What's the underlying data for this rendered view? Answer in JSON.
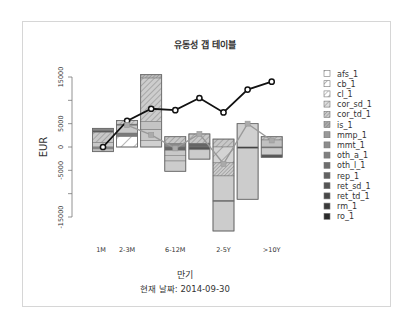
{
  "chart_data": {
    "type": "bar",
    "title": "유동성 갭 테이블",
    "xlabel": "만기",
    "subtitle": "현재 날짜: 2014-09-30",
    "ylabel": "EUR",
    "ylim": [
      -18000,
      16000
    ],
    "yticks": [
      15000,
      10000,
      5000,
      0,
      -5000,
      -10000,
      -15000
    ],
    "ytick_labels": [
      "15000",
      "",
      "5000",
      "0",
      "-5000",
      "",
      "-15000"
    ],
    "categories": [
      "1M",
      "2-3M",
      "3-6M",
      "6-12M",
      "1-2Y",
      "2-5Y",
      "5-10Y",
      ">10Y"
    ],
    "category_labels_shown": [
      "1M",
      "2-3M",
      "",
      "6-12M",
      "",
      "2-5Y",
      "",
      ">10Y"
    ],
    "bars": [
      {
        "category": "1M",
        "segments": [
          {
            "from": 0,
            "to": 1000,
            "fill": "#c8c8c8",
            "pattern": "none"
          },
          {
            "from": 1000,
            "to": 3200,
            "fill": "#c8c8c8",
            "pattern": "hatch"
          },
          {
            "from": 3200,
            "to": 3600,
            "fill": "#555555",
            "pattern": "none"
          },
          {
            "from": 3600,
            "to": 4000,
            "fill": "#888888",
            "pattern": "none"
          },
          {
            "from": -400,
            "to": 0,
            "fill": "#888888",
            "pattern": "none"
          },
          {
            "from": -1000,
            "to": -400,
            "fill": "#bdbdbd",
            "pattern": "none"
          }
        ]
      },
      {
        "category": "2-3M",
        "segments": [
          {
            "from": 0,
            "to": 2300,
            "fill": "#ffffff",
            "pattern": "hatch-sparse"
          },
          {
            "from": 2300,
            "to": 3000,
            "fill": "#7a7a7a",
            "pattern": "none"
          },
          {
            "from": 3000,
            "to": 4700,
            "fill": "#c8c8c8",
            "pattern": "none"
          },
          {
            "from": 4700,
            "to": 4900,
            "fill": "#444444",
            "pattern": "none"
          },
          {
            "from": 4900,
            "to": 5700,
            "fill": "#cfcfcf",
            "pattern": "hatch"
          }
        ]
      },
      {
        "category": "3-6M",
        "segments": [
          {
            "from": 0,
            "to": 1400,
            "fill": "#d0d0d0",
            "pattern": "none"
          },
          {
            "from": 1400,
            "to": 3800,
            "fill": "#c8c8c8",
            "pattern": "none"
          },
          {
            "from": 3800,
            "to": 5500,
            "fill": "#c4c4c4",
            "pattern": "none"
          },
          {
            "from": 5500,
            "to": 14800,
            "fill": "#cdcdcd",
            "pattern": "hatch"
          },
          {
            "from": 14800,
            "to": 15500,
            "fill": "#bbbbbb",
            "pattern": "hatch-dense"
          }
        ]
      },
      {
        "category": "6-12M",
        "segments": [
          {
            "from": 700,
            "to": 2200,
            "fill": "#c8c8c8",
            "pattern": "hatch"
          },
          {
            "from": 0,
            "to": 700,
            "fill": "#888888",
            "pattern": "none"
          },
          {
            "from": -700,
            "to": 0,
            "fill": "#666666",
            "pattern": "none"
          },
          {
            "from": -1800,
            "to": -700,
            "fill": "#c8c8c8",
            "pattern": "none"
          },
          {
            "from": -3000,
            "to": -1800,
            "fill": "#c8c8c8",
            "pattern": "none"
          },
          {
            "from": -5200,
            "to": -3000,
            "fill": "#cccccc",
            "pattern": "none"
          }
        ]
      },
      {
        "category": "1-2Y",
        "segments": [
          {
            "from": 800,
            "to": 2800,
            "fill": "#c8c8c8",
            "pattern": "hatch"
          },
          {
            "from": 0,
            "to": 800,
            "fill": "#666666",
            "pattern": "none"
          },
          {
            "from": -600,
            "to": 0,
            "fill": "#555555",
            "pattern": "none"
          },
          {
            "from": -2600,
            "to": -600,
            "fill": "#cccccc",
            "pattern": "none"
          }
        ]
      },
      {
        "category": "2-5Y",
        "segments": [
          {
            "from": 0,
            "to": 1700,
            "fill": "#c8c8c8",
            "pattern": "hatch"
          },
          {
            "from": -3400,
            "to": 0,
            "fill": "#d4d4d4",
            "pattern": "hatch-sparse"
          },
          {
            "from": -6200,
            "to": -3400,
            "fill": "#cccccc",
            "pattern": "hatch-dense"
          },
          {
            "from": -11500,
            "to": -6200,
            "fill": "#cccccc",
            "pattern": "none"
          },
          {
            "from": -11700,
            "to": -11500,
            "fill": "#333333",
            "pattern": "none"
          },
          {
            "from": -18000,
            "to": -11700,
            "fill": "#cccccc",
            "pattern": "none"
          }
        ]
      },
      {
        "category": "5-10Y",
        "segments": [
          {
            "from": 0,
            "to": 5000,
            "fill": "#d0d0d0",
            "pattern": "none"
          },
          {
            "from": -300,
            "to": 0,
            "fill": "#333333",
            "pattern": "none"
          },
          {
            "from": -11200,
            "to": -300,
            "fill": "#cccccc",
            "pattern": "none"
          }
        ]
      },
      {
        "category": ">10Y",
        "segments": [
          {
            "from": 1500,
            "to": 2200,
            "fill": "#c8c8c8",
            "pattern": "hatch"
          },
          {
            "from": 0,
            "to": 1500,
            "fill": "#c0c0c0",
            "pattern": "none"
          },
          {
            "from": -200,
            "to": 0,
            "fill": "#555555",
            "pattern": "none"
          },
          {
            "from": -1700,
            "to": -200,
            "fill": "#cccccc",
            "pattern": "none"
          },
          {
            "from": -2200,
            "to": -1700,
            "fill": "#555555",
            "pattern": "none"
          }
        ]
      }
    ],
    "series": [
      {
        "name": "cumulative-gap",
        "style": "black line with open circles",
        "color": "#111111",
        "values": [
          0,
          5600,
          8200,
          7900,
          10500,
          7400,
          12300,
          14000
        ]
      },
      {
        "name": "net-gap",
        "style": "gray line with squares",
        "color": "#999999",
        "values": [
          null,
          4700,
          2600,
          -300,
          2800,
          -3600,
          5000,
          1400
        ]
      }
    ],
    "legend": {
      "placement": "right",
      "entries": [
        {
          "label": "afs_1",
          "fill": "#ffffff",
          "pattern": "hatch-sparse"
        },
        {
          "label": "cb_1",
          "fill": "#ffffff",
          "pattern": "hatch-sparse"
        },
        {
          "label": "cl_1",
          "fill": "#ffffff",
          "pattern": "hatch"
        },
        {
          "label": "cor_sd_1",
          "fill": "#dddddd",
          "pattern": "hatch"
        },
        {
          "label": "cor_td_1",
          "fill": "#cccccc",
          "pattern": "hatch-dense"
        },
        {
          "label": "is_1",
          "fill": "#aaaaaa",
          "pattern": "hatch-dense"
        },
        {
          "label": "mmp_1",
          "fill": "#999999",
          "pattern": "none"
        },
        {
          "label": "mmt_1",
          "fill": "#8c8c8c",
          "pattern": "none"
        },
        {
          "label": "oth_a_1",
          "fill": "#808080",
          "pattern": "none"
        },
        {
          "label": "oth_l_1",
          "fill": "#6e6e6e",
          "pattern": "none"
        },
        {
          "label": "rep_1",
          "fill": "#626262",
          "pattern": "none"
        },
        {
          "label": "ret_sd_1",
          "fill": "#555555",
          "pattern": "none"
        },
        {
          "label": "ret_td_1",
          "fill": "#484848",
          "pattern": "none"
        },
        {
          "label": "rm_1",
          "fill": "#3a3a3a",
          "pattern": "none"
        },
        {
          "label": "ro_1",
          "fill": "#2b2b2b",
          "pattern": "none"
        }
      ]
    },
    "grid": false
  }
}
